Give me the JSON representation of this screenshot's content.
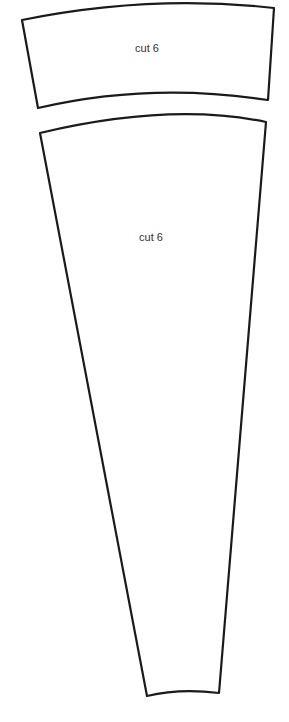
{
  "pieces": [
    {
      "id": "band",
      "label": "cut 6",
      "label_x": 147,
      "label_y": 42
    },
    {
      "id": "gore",
      "label": "cut 6",
      "label_x": 151,
      "label_y": 231
    }
  ],
  "colors": {
    "outline": "#1a1a1a",
    "text": "#333333",
    "background": "#ffffff"
  }
}
